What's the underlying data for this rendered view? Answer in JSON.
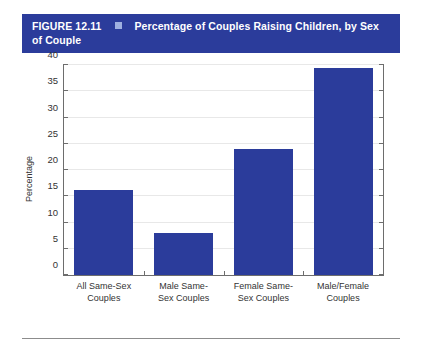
{
  "figure": {
    "number_label": "FIGURE 12.11",
    "separator_icon": "square-bullet-icon",
    "title": "Percentage of Couples Raising Children, by Sex of Couple",
    "banner_color": "#2b3c9b",
    "bullet_color": "#9fb0e0"
  },
  "chart_data": {
    "type": "bar",
    "title": "Percentage of Couples Raising Children, by Sex of Couple",
    "categories": [
      "All Same-Sex\nCouples",
      "Male Same-\nSex Couples",
      "Female Same-\nSex Couples",
      "Male/Female\nCouples"
    ],
    "values": [
      16.2,
      8.0,
      24.0,
      39.4
    ],
    "xlabel": "",
    "ylabel": "Percentage",
    "ylim": [
      0,
      40
    ],
    "yticks": [
      0,
      5,
      10,
      15,
      20,
      25,
      30,
      35,
      40
    ],
    "ytick_labels": [
      "0",
      "5",
      "10",
      "15",
      "20",
      "25",
      "30",
      "35",
      "40"
    ],
    "grid": true,
    "legend": false,
    "bar_color": "#2b3c9b",
    "gridline_color": "#e8e8e8",
    "axis_color": "#6d6d6d"
  }
}
